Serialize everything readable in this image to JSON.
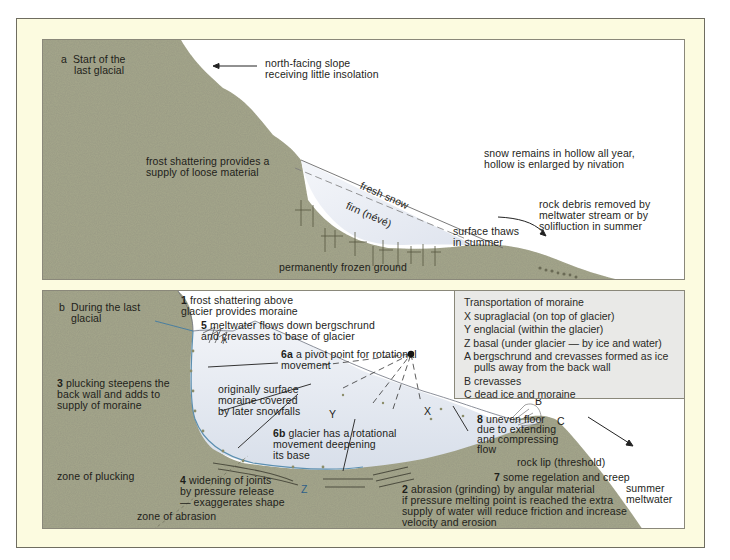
{
  "colors": {
    "frame_bg": "#fcfbe0",
    "rock": "#a3a48a",
    "rock_dark": "#8e8f74",
    "ice": "#e8ecf4",
    "legend_bg": "#e9e9e7",
    "text": "#1e1e1a"
  },
  "panel_a": {
    "title_letter": "a",
    "title_line1": "Start of the",
    "title_line2": "last glacial",
    "labels": {
      "north_slope_1": "north-facing slope",
      "north_slope_2": "receiving little insolation",
      "frost_1": "frost shattering provides a",
      "frost_2": "supply of loose material",
      "snow_hollow_1": "snow remains in hollow all year,",
      "snow_hollow_2": "hollow is enlarged by nivation",
      "fresh_snow": "fresh snow",
      "firn": "firn (névé)",
      "rock_debris_1": "rock debris removed by",
      "rock_debris_2": "meltwater stream or by",
      "rock_debris_3": "solifluction in summer",
      "surface_thaws_1": "surface thaws",
      "surface_thaws_2": "in summer",
      "frozen_ground": "permanently frozen ground"
    }
  },
  "panel_b": {
    "title_letter": "b",
    "title_line1": "During the last",
    "title_line2": "glacial",
    "labels": {
      "n1": "1",
      "l1_a": " frost shattering above",
      "l1_b": "glacier provides moraine",
      "n5": "5",
      "l5_a": " meltwater flows down bergschrund",
      "l5_b": "and crevasses to base of glacier",
      "n6a": "6a",
      "l6a_a": " a pivot point for rotational",
      "l6a_b": "movement",
      "n3": "3",
      "l3_a": " plucking steepens the",
      "l3_b": "back wall and adds to",
      "l3_c": "supply of moraine",
      "orig_1": "originally surface",
      "orig_2": "moraine covered",
      "orig_3": "by later snowfalls",
      "n6b": "6b",
      "l6b_a": " glacier has a rotational",
      "l6b_b": "movement deepening",
      "l6b_c": "its base",
      "n8": "8",
      "l8_a": " uneven floor",
      "l8_b": "due to extending",
      "l8_c": "and compressing",
      "l8_d": "flow",
      "rock_lip": "rock lip (threshold)",
      "n7": "7",
      "l7": " some regelation and creep",
      "zone_plucking": "zone of plucking",
      "n4": "4",
      "l4_a": " widening of joints",
      "l4_b": "by pressure release",
      "l4_c": "— exaggerates shape",
      "zone_abrasion": "zone of abrasion",
      "n2": "2",
      "l2_a": " abrasion (grinding) by angular material",
      "l2_b": "if pressure melting point is reached the extra",
      "l2_c": "supply of water will reduce friction and increase",
      "l2_d": "velocity and erosion",
      "summer_1": "summer",
      "summer_2": "meltwater",
      "mark_x": "X",
      "mark_y": "Y",
      "mark_z": "Z",
      "mark_a": "A",
      "mark_b": "B",
      "mark_c": "C"
    },
    "legend": {
      "title": "Transportation of moraine",
      "items": [
        "X supraglacial (on top of glacier)",
        "Y englacial (within the glacier)",
        "Z basal (under glacier — by ice and water)",
        "A bergschrund and crevasses formed as ice",
        "pulls away from the back wall",
        "B crevasses",
        "C dead ice and moraine"
      ]
    }
  }
}
